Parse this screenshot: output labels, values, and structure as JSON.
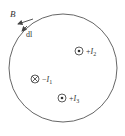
{
  "diagram": {
    "type": "amperian-loop",
    "loop": {
      "shape": "circle",
      "cx": 63,
      "cy": 68,
      "r": 54,
      "stroke": "#555555"
    },
    "field_label": "B",
    "element_label": "dl",
    "currents": [
      {
        "id": "I1",
        "sign": "−",
        "name": "I",
        "sub": "1",
        "direction": "into-page",
        "symbol": "⊗",
        "x": 35,
        "y": 79
      },
      {
        "id": "I2",
        "sign": "+",
        "name": "I",
        "sub": "2",
        "direction": "out-of-page",
        "symbol": "⊙",
        "x": 79,
        "y": 51
      },
      {
        "id": "I3",
        "sign": "+",
        "name": "I",
        "sub": "3",
        "direction": "out-of-page",
        "symbol": "⊙",
        "x": 62,
        "y": 98
      }
    ]
  }
}
